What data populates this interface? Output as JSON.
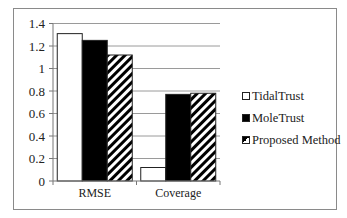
{
  "chart_data": {
    "type": "bar",
    "title": "",
    "xlabel": "",
    "ylabel": "",
    "categories": [
      "RMSE",
      "Coverage"
    ],
    "series": [
      {
        "name": "TidalTrust",
        "values": [
          1.31,
          0.12
        ],
        "fill": "white"
      },
      {
        "name": "MoleTrust",
        "values": [
          1.25,
          0.77
        ],
        "fill": "black"
      },
      {
        "name": "Proposed Method",
        "values": [
          1.12,
          0.78
        ],
        "fill": "hatched"
      }
    ],
    "ylim": [
      0,
      1.4
    ],
    "yticks": [
      "0",
      "0.2",
      "0.4",
      "0.6",
      "0.8",
      "1",
      "1.2",
      "1.4"
    ],
    "grid": true,
    "legend_position": "right"
  },
  "legend": {
    "items": [
      "TidalTrust",
      "MoleTrust",
      "Proposed Method"
    ]
  },
  "colors": {
    "grid": "#9a9a9a",
    "frame": "#8a8a8a",
    "bar_outline": "#222222"
  }
}
